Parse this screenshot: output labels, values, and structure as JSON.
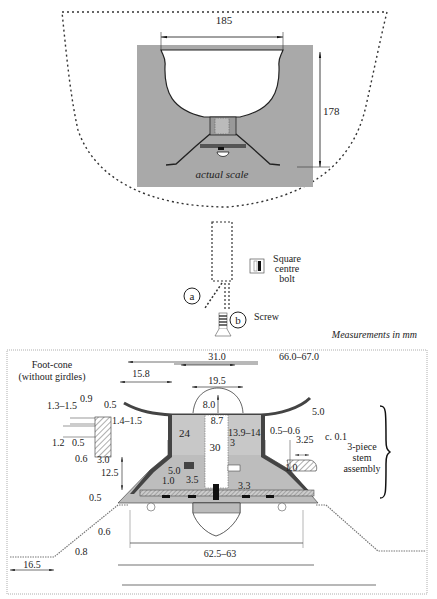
{
  "top_view": {
    "width_label": "185",
    "height_label": "178",
    "scale_label": "actual scale",
    "circle_a": "a",
    "circle_b": "b",
    "bolt_label_1": "Square",
    "bolt_label_2": "centre",
    "bolt_label_3": "bolt",
    "screw_label": "Screw",
    "units_note": "Measurements in mm"
  },
  "detail_view": {
    "title_1": "Foot-cone",
    "title_2": "(without girdles)",
    "stem_label_1": "3-piece",
    "stem_label_2": "stem",
    "stem_label_3": "assembly",
    "dims": {
      "d_15_8": "15.8",
      "d_31_0": "31.0",
      "d_66_67": "66.0–67.0",
      "d_19_5": "19.5",
      "d_8_0": "8.0",
      "d_8_7": "8.7",
      "d_5_0_top": "5.0",
      "d_1_3_1_5": "1.3–1.5",
      "d_0_9": "0.9",
      "d_0_5_a": "0.5",
      "d_1_4_1_5": "1.4–1.5",
      "d_1_2": "1.2",
      "d_0_5_b": "0.5",
      "d_0_6_a": "0.6",
      "d_3_0": "3.0",
      "d_24": "24",
      "d_30": "30",
      "d_13_9_14": "13.9–14",
      "d_3": "3",
      "d_0_5_0_6": "0.5–0.6",
      "d_3_25": "3.25",
      "d_c01": "c. 0.1",
      "d_1_0_b": "1.0",
      "d_12_5": "12.5",
      "d_5_0_mid": "5.0",
      "d_1_0_a": "1.0",
      "d_3_5": "3.5",
      "d_3_3": "3.3",
      "d_0_5_c": "0.5",
      "d_0_6_b": "0.6",
      "d_0_8": "0.8",
      "d_62_5_63": "62.5–63",
      "d_16_5": "16.5"
    }
  },
  "colors": {
    "panel_grey": "#a9a9a9",
    "fill_grey": "#bdbdbd",
    "dark": "#333333",
    "line": "#222222"
  }
}
